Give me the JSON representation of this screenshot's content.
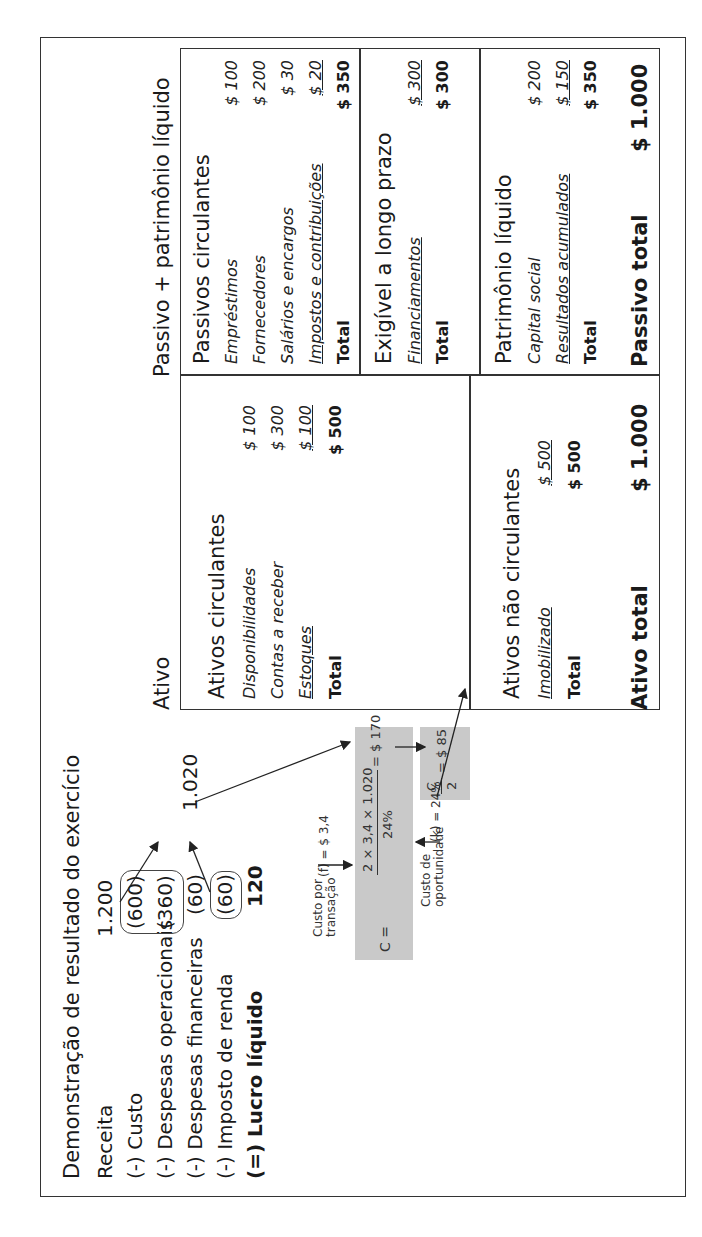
{
  "income_statement": {
    "title": "Demonstração de resultado do exercício",
    "rows": [
      {
        "label": "Receita",
        "value": "1.200"
      },
      {
        "label": "(-) Custo",
        "value": "(600)"
      },
      {
        "label": "(-) Despesas operacionais",
        "value": "(360)"
      },
      {
        "label": "(-) Despesas financeiras",
        "value": "(60)"
      },
      {
        "label": "(-) Imposto de renda",
        "value": "(60)"
      },
      {
        "label": "(=) Lucro líquido",
        "value": "120"
      }
    ],
    "total_outflows": "1.020"
  },
  "formula": {
    "lhs": "C =",
    "numerator": "2 × 3,4 × 1.020",
    "denominator": "24%",
    "result": "= $ 170",
    "half_num": "C",
    "half_den": "2",
    "half_result": "= $ 85",
    "f_label_line1": "Custo por",
    "f_label_line2": "transação",
    "f_value": "(f) = $ 3,4",
    "k_label_line1": "Custo de",
    "k_label_line2": "oportunidade",
    "k_value": "(k) = 24%"
  },
  "balance_sheet": {
    "assets_heading": "Ativo",
    "liabilities_heading": "Passivo + patrimônio líquido",
    "current_assets": {
      "title": "Ativos circulantes",
      "items": [
        {
          "label": "Disponibilidades",
          "value": "$ 100"
        },
        {
          "label": "Contas a receber",
          "value": "$ 300"
        },
        {
          "label": "Estoques",
          "value": "$ 100"
        }
      ],
      "total_label": "Total",
      "total": "$ 500"
    },
    "noncurrent_assets": {
      "title": "Ativos não circulantes",
      "items": [
        {
          "label": "Imobilizado",
          "value": "$ 500"
        }
      ],
      "total_label": "Total",
      "total": "$ 500"
    },
    "current_liabilities": {
      "title": "Passivos circulantes",
      "items": [
        {
          "label": "Empréstimos",
          "value": "$ 100"
        },
        {
          "label": "Fornecedores",
          "value": "$ 200"
        },
        {
          "label": "Salários e encargos",
          "value": "$ 30"
        },
        {
          "label": "Impostos e contribuições",
          "value": "$ 20"
        }
      ],
      "total_label": "Total",
      "total": "$ 350"
    },
    "long_term_liabilities": {
      "title": "Exigível a longo prazo",
      "items": [
        {
          "label": "Financiamentos",
          "value": "$ 300"
        }
      ],
      "total_label": "Total",
      "total": "$ 300"
    },
    "equity": {
      "title": "Patrimônio líquido",
      "items": [
        {
          "label": "Capital social",
          "value": "$ 200"
        },
        {
          "label": "Resultados acumulados",
          "value": "$ 150"
        }
      ],
      "total_label": "Total",
      "total": "$ 350"
    },
    "total_assets_label": "Ativo total",
    "total_assets": "$ 1.000",
    "total_liabilities_label": "Passivo total",
    "total_liabilities": "$ 1.000"
  }
}
